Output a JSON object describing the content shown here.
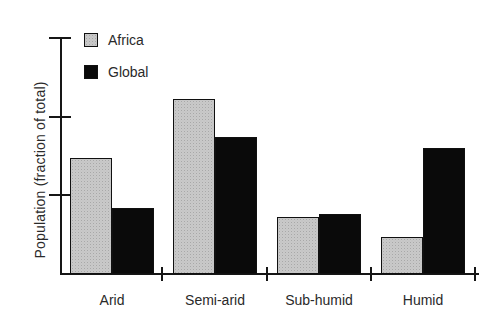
{
  "chart_data": {
    "type": "bar",
    "title": "",
    "xlabel": "",
    "ylabel": "Population (fraction of total)",
    "categories": [
      "Arid",
      "Semi-arid",
      "Sub-humid",
      "Humid"
    ],
    "series": [
      {
        "name": "Africa",
        "color": "#c9c9c9",
        "fill_style": "stippled-gray",
        "values": [
          0.295,
          0.445,
          0.145,
          0.095
        ]
      },
      {
        "name": "Global",
        "color": "#0a0a0a",
        "fill_style": "solid-black",
        "values": [
          0.168,
          0.348,
          0.152,
          0.32
        ]
      }
    ],
    "ylim": [
      0,
      0.6
    ],
    "yticks": [
      0.2,
      0.4,
      0.6
    ],
    "ytick_labels_visible": false,
    "xtick_labels_visible": true,
    "grid": false,
    "legend_position": "top-left"
  },
  "colors": {
    "axis": "#161616",
    "text": "#2a2a2a",
    "background": "#ffffff"
  }
}
